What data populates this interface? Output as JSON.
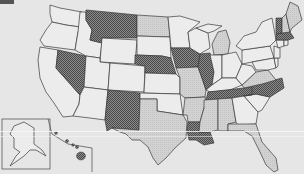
{
  "map": {
    "type": "choropleth",
    "region": "United States",
    "legend": [],
    "categories": {
      "dark": {
        "fill": "#6e6e6e",
        "pattern": "crosshatch"
      },
      "light": {
        "fill": "#cfcfcf"
      },
      "none": {
        "fill": "#ececec"
      }
    },
    "states": {
      "dark": [
        "Montana",
        "Nevada",
        "Nebraska",
        "Iowa",
        "Illinois",
        "New Mexico",
        "Tennessee",
        "North Carolina",
        "Louisiana",
        "Vermont",
        "Massachusetts",
        "Hawaii"
      ],
      "light": [
        "North Dakota",
        "Utah",
        "Michigan",
        "Missouri",
        "Texas",
        "Arkansas",
        "Mississippi",
        "Alabama",
        "Florida",
        "Virginia",
        "Maine",
        "New Hampshire"
      ],
      "none": [
        "Washington",
        "Oregon",
        "California",
        "Idaho",
        "Wyoming",
        "Colorado",
        "Arizona",
        "South Dakota",
        "Kansas",
        "Oklahoma",
        "Minnesota",
        "Wisconsin",
        "Indiana",
        "Ohio",
        "Kentucky",
        "West Virginia",
        "Pennsylvania",
        "New York",
        "New Jersey",
        "Connecticut",
        "Rhode Island",
        "Delaware",
        "Maryland",
        "Georgia",
        "South Carolina",
        "Alaska"
      ]
    },
    "insets": [
      "Alaska",
      "Hawaii"
    ]
  }
}
